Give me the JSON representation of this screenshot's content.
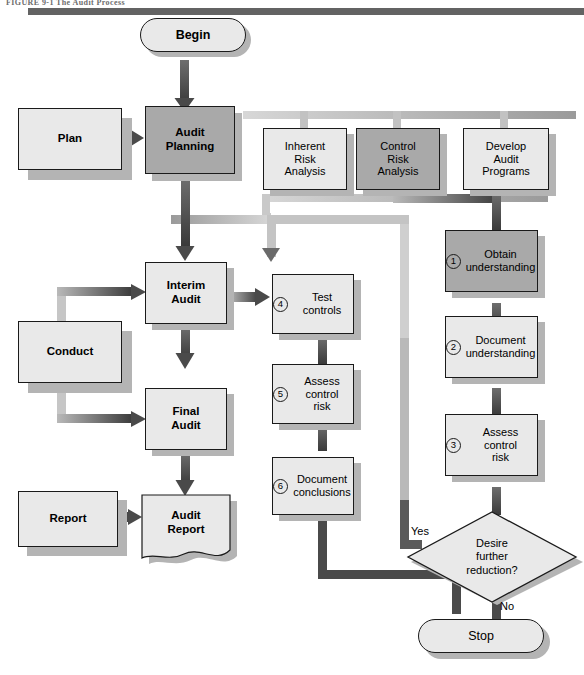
{
  "figure": {
    "caption": "FIGURE 9-1   The Audit Process"
  },
  "palette": {
    "box_light": "#e9e9e9",
    "box_shaded": "#a9a9a9",
    "outline": "#1a1a1a",
    "shadow": "#b4b4b4",
    "connector_dark": "#4a4a4a",
    "connector_light": "#c9c9c9",
    "rule": "#636363"
  },
  "terminators": {
    "begin": "Begin",
    "stop": "Stop"
  },
  "phase_inputs": [
    {
      "id": "plan",
      "label": "Plan"
    },
    {
      "id": "conduct",
      "label": "Conduct"
    },
    {
      "id": "report",
      "label": "Report"
    }
  ],
  "main_steps": [
    {
      "id": "audit-planning",
      "label": "Audit\nPlanning",
      "line1": "Audit",
      "line2": "Planning",
      "shaded": true
    },
    {
      "id": "interim-audit",
      "label": "Interim\nAudit",
      "line1": "Interim",
      "line2": "Audit",
      "shaded": false
    },
    {
      "id": "final-audit",
      "label": "Final\nAudit",
      "line1": "Final",
      "line2": "Audit",
      "shaded": false
    },
    {
      "id": "audit-report",
      "label": "Audit\nReport",
      "line1": "Audit",
      "line2": "Report",
      "shaded": false
    }
  ],
  "planning_tasks": [
    {
      "id": "inherent-risk-analysis",
      "line1": "Inherent",
      "line2": "Risk",
      "line3": "Analysis",
      "shaded": false
    },
    {
      "id": "control-risk-analysis",
      "line1": "Control",
      "line2": "Risk",
      "line3": "Analysis",
      "shaded": true
    },
    {
      "id": "develop-audit-programs",
      "line1": "Develop",
      "line2": "Audit",
      "line3": "Programs",
      "shaded": false
    }
  ],
  "control_risk_steps": [
    {
      "num": "1",
      "line1": "Obtain",
      "line2": "understanding",
      "line3": "",
      "shaded": true
    },
    {
      "num": "2",
      "line1": "Document",
      "line2": "understanding",
      "line3": "",
      "shaded": false
    },
    {
      "num": "3",
      "line1": "Assess",
      "line2": "control",
      "line3": "risk",
      "shaded": false
    },
    {
      "num": "4",
      "line1": "Test",
      "line2": "controls",
      "line3": "",
      "shaded": false
    },
    {
      "num": "5",
      "line1": "Assess",
      "line2": "control",
      "line3": "risk",
      "shaded": false
    },
    {
      "num": "6",
      "line1": "Document",
      "line2": "conclusions",
      "line3": "",
      "shaded": false
    }
  ],
  "decision": {
    "id": "desire-further-reduction",
    "line1": "Desire",
    "line2": "further",
    "line3": "reduction?",
    "yes_label": "Yes",
    "no_label": "No"
  }
}
